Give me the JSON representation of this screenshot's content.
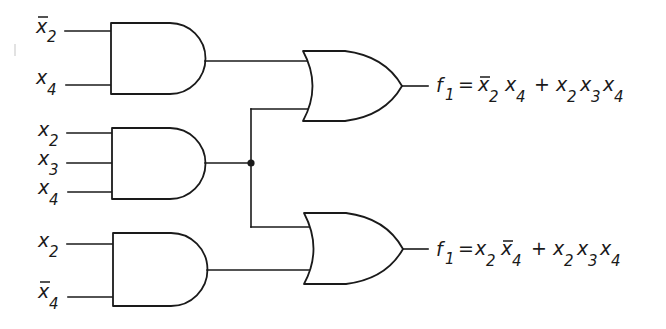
{
  "diagram": {
    "type": "logic-circuit",
    "and_gates": [
      {
        "id": "and1",
        "inputs": [
          {
            "var": "x",
            "sub": "2",
            "negated": true
          },
          {
            "var": "x",
            "sub": "4",
            "negated": false
          }
        ]
      },
      {
        "id": "and2",
        "inputs": [
          {
            "var": "x",
            "sub": "2",
            "negated": false
          },
          {
            "var": "x",
            "sub": "3",
            "negated": false
          },
          {
            "var": "x",
            "sub": "4",
            "negated": false
          }
        ]
      },
      {
        "id": "and3",
        "inputs": [
          {
            "var": "x",
            "sub": "2",
            "negated": false
          },
          {
            "var": "x",
            "sub": "4",
            "negated": true
          }
        ]
      }
    ],
    "or_gates": [
      {
        "id": "or1",
        "inputs_from": [
          "and1",
          "and2"
        ]
      },
      {
        "id": "or2",
        "inputs_from": [
          "and2",
          "and3"
        ]
      }
    ],
    "outputs": [
      {
        "id": "out1",
        "name": "f",
        "name_sub": "1",
        "equals": "=",
        "plus": "+",
        "term1": [
          {
            "var": "x",
            "sub": "2",
            "negated": true
          },
          {
            "var": "x",
            "sub": "4",
            "negated": false
          }
        ],
        "term2": [
          {
            "var": "x",
            "sub": "2",
            "negated": false
          },
          {
            "var": "x",
            "sub": "3",
            "negated": false
          },
          {
            "var": "x",
            "sub": "4",
            "negated": false
          }
        ],
        "text": "f1 = x̄2 x4 + x2 x3 x4"
      },
      {
        "id": "out2",
        "name": "f",
        "name_sub": "1",
        "equals": "=",
        "plus": "+",
        "term1": [
          {
            "var": "x",
            "sub": "2",
            "negated": false
          },
          {
            "var": "x",
            "sub": "4",
            "negated": true
          }
        ],
        "term2": [
          {
            "var": "x",
            "sub": "2",
            "negated": false
          },
          {
            "var": "x",
            "sub": "3",
            "negated": false
          },
          {
            "var": "x",
            "sub": "4",
            "negated": false
          }
        ],
        "text": "f1 = x2 x̄4 + x2 x3 x4"
      }
    ],
    "junction": {
      "from": "and2",
      "to": [
        "or1",
        "or2"
      ]
    }
  }
}
